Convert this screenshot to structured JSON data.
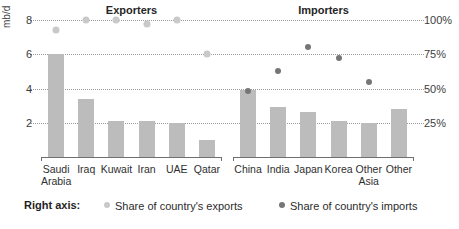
{
  "chart_data": {
    "type": "bar",
    "title": "",
    "ylabel": "mb/d",
    "ylabel_right": "",
    "ylim": [
      0,
      8.7
    ],
    "ylim_right": [
      0,
      108.75
    ],
    "yticks": [
      "2",
      "4",
      "6",
      "8"
    ],
    "ytick_values": [
      2,
      4,
      6,
      8
    ],
    "yticks_right": [
      "25%",
      "50%",
      "75%",
      "100%"
    ],
    "ytick_values_right": [
      25,
      50,
      75,
      100
    ],
    "grid": true,
    "legend_position": "bottom",
    "panels": [
      {
        "heading": "Exporters",
        "categories": [
          "Saudi Arabia",
          "Iraq",
          "Kuwait",
          "Iran",
          "UAE",
          "Qatar"
        ],
        "series": [
          {
            "name": "Crude oil trade",
            "kind": "bar",
            "axis": "left",
            "color": "#bcbcbc",
            "values": [
              6.0,
              3.4,
              2.1,
              2.1,
              2.0,
              1.0
            ]
          },
          {
            "name": "Share of country's exports",
            "kind": "scatter",
            "axis": "right",
            "color": "#c9c9c9",
            "values": [
              93,
              100,
              100,
              97,
              100,
              75
            ]
          }
        ]
      },
      {
        "heading": "Importers",
        "categories": [
          "China",
          "India",
          "Japan",
          "Korea",
          "Other Asia",
          "Other"
        ],
        "series": [
          {
            "name": "Crude oil trade",
            "kind": "bar",
            "axis": "left",
            "color": "#bcbcbc",
            "values": [
              3.9,
              2.9,
              2.6,
              2.1,
              2.0,
              2.8
            ]
          },
          {
            "name": "Share of country's imports",
            "kind": "scatter",
            "axis": "right",
            "color": "#767676",
            "values": [
              48,
              63,
              80,
              72,
              55,
              null
            ]
          }
        ]
      }
    ]
  },
  "legend": {
    "title": "Right axis:",
    "entries": [
      {
        "label": "Share of country's exports",
        "color": "#c9c9c9"
      },
      {
        "label": "Share of country's imports",
        "color": "#767676"
      }
    ]
  },
  "source_note": ""
}
